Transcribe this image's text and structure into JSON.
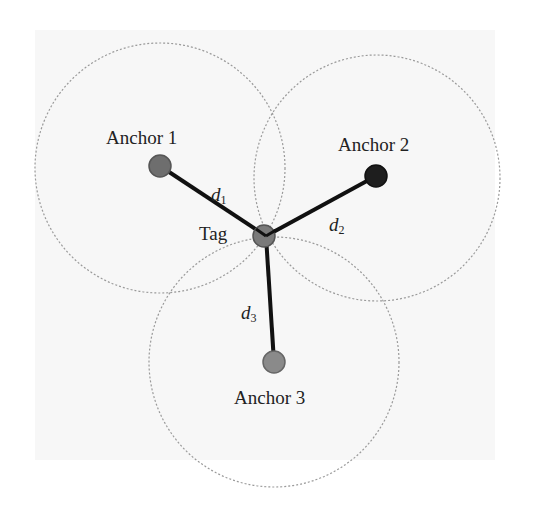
{
  "diagram": {
    "type": "trilateration",
    "nodes": {
      "anchor1": {
        "label": "Anchor 1",
        "color": "#6e6e6e"
      },
      "anchor2": {
        "label": "Anchor 2",
        "color": "#1e1e1e"
      },
      "anchor3": {
        "label": "Anchor 3",
        "color": "#8a8a8a"
      },
      "tag": {
        "label": "Tag",
        "color": "#7a7a7a"
      }
    },
    "distances": {
      "d1": {
        "symbol": "d",
        "sub": "1"
      },
      "d2": {
        "symbol": "d",
        "sub": "2"
      },
      "d3": {
        "symbol": "d",
        "sub": "3"
      }
    },
    "range_circle_style": "dotted",
    "edge_color": "#111111"
  }
}
